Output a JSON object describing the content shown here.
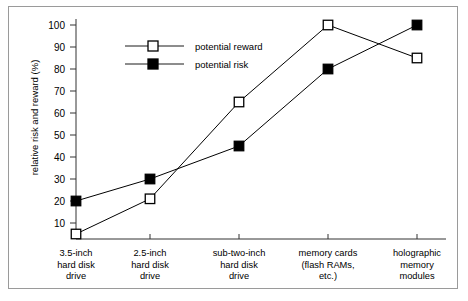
{
  "chart_data": {
    "type": "line",
    "title": "",
    "xlabel": "",
    "ylabel": "relative risk and reward (%)",
    "ylim": [
      0,
      105
    ],
    "yticks": [
      10,
      20,
      30,
      40,
      50,
      60,
      70,
      80,
      90,
      100
    ],
    "grid": false,
    "legend_position": "top-left-inside",
    "categories": [
      "3.5-inch hard disk drive",
      "2.5-inch hard disk drive",
      "sub-two-inch hard disk drive",
      "memory cards (flash RAMs, etc.)",
      "holographic memory modules"
    ],
    "category_lines": [
      [
        "3.5-inch",
        "hard disk",
        "drive"
      ],
      [
        "2.5-inch",
        "hard disk",
        "drive"
      ],
      [
        "sub-two-inch",
        "hard disk",
        "drive"
      ],
      [
        "memory cards",
        "(flash RAMs,",
        "etc.)"
      ],
      [
        "holographic",
        "memory",
        "modules"
      ]
    ],
    "series": [
      {
        "name": "potential reward",
        "marker": "open-square",
        "color": "#000000",
        "values": [
          5,
          21,
          65,
          100,
          85
        ]
      },
      {
        "name": "potential risk",
        "marker": "filled-square",
        "color": "#000000",
        "values": [
          20,
          30,
          45,
          80,
          100
        ]
      }
    ]
  },
  "legend": {
    "items": [
      {
        "label": "potential reward",
        "marker": "open-square"
      },
      {
        "label": "potential risk",
        "marker": "filled-square"
      }
    ]
  },
  "axis": {
    "y_title": "relative risk and reward (%)",
    "y_tick_labels": [
      "100",
      "90",
      "80",
      "70",
      "60",
      "50",
      "40",
      "30",
      "20",
      "10"
    ]
  },
  "colors": {
    "frame": "#9a9a9a",
    "line": "#1a1a1a",
    "axis": "#333333",
    "marker_fill_open": "#ffffff",
    "marker_fill_closed": "#000000",
    "background": "#ffffff"
  }
}
